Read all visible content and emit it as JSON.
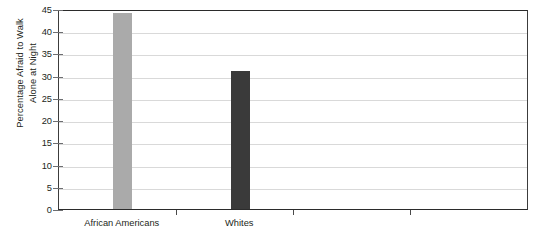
{
  "chart_data": {
    "type": "bar",
    "title": "",
    "xlabel": "",
    "ylabel": "Percentage Afraid to Walk\nAlone at Night",
    "categories": [
      "African Americans",
      "Whites"
    ],
    "values": [
      44,
      31
    ],
    "series": [
      {
        "name": "Percentage Afraid to Walk Alone at Night",
        "values": [
          44,
          31
        ],
        "colors": [
          "#aaaaaa",
          "#3a3a3a"
        ]
      }
    ],
    "ylim": [
      0,
      45
    ],
    "ytick_labels": [
      "0",
      "5",
      "10",
      "15",
      "20",
      "25",
      "30",
      "35",
      "40",
      "45"
    ],
    "ytick_values": [
      0,
      5,
      10,
      15,
      20,
      25,
      30,
      35,
      40,
      45
    ],
    "ytick_interval": 5,
    "grid": true,
    "grid_axis": "y",
    "legend": false,
    "legend_position": "none",
    "x_tick_positions": [
      176,
      293,
      410
    ],
    "bar_colors": {
      "african_americans": "#aaaaaa",
      "whites": "#3a3a3a"
    },
    "axis_color": "#3c3c3c",
    "gridline_color": "#d9d9d9",
    "background_color": "#ffffff"
  }
}
